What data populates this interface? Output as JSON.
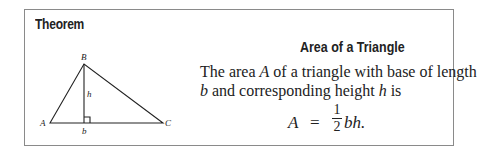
{
  "theorem_box": {
    "heading": "Theorem",
    "title": "Area of a Triangle",
    "statement": {
      "line1_prefix": "The area ",
      "line1_var": "A",
      "line1_suffix": " of a triangle with base of length",
      "line2_var1": "b",
      "line2_mid": " and corresponding height ",
      "line2_var2": "h",
      "line2_suffix": " is"
    },
    "formula": {
      "lhs": "A",
      "equals": "=",
      "numerator": "1",
      "denominator": "2",
      "rhs": "bh."
    }
  },
  "figure": {
    "vertex_labels": {
      "A": "A",
      "B": "B",
      "C": "C"
    },
    "height_label": "h",
    "base_label": "b",
    "colors": {
      "stroke": "#222222"
    }
  }
}
